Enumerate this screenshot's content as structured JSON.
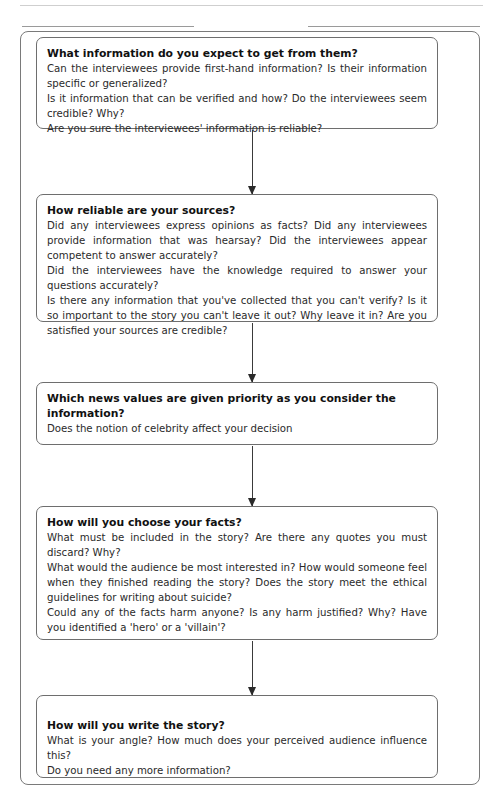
{
  "flowchart": {
    "steps": [
      {
        "title": "What information do you expect to get from them?",
        "lines": [
          "Can the interviewees provide first-hand information? Is their information specific or generalized?",
          "Is it information that can be verified and how? Do the interviewees seem credible? Why?",
          "Are you sure the interviewees' information is reliable?"
        ]
      },
      {
        "title": "How reliable are your sources?",
        "lines": [
          "Did any interviewees express opinions as facts? Did any interviewees provide information that was hearsay? Did the interviewees appear competent to answer accurately?",
          "Did the interviewees have the knowledge required to answer your questions accurately?",
          "Is there any information that you've collected that you can't verify? Is it so important to the story you can't leave it out? Why leave it in? Are you satisfied your sources are credible?"
        ]
      },
      {
        "title": "Which news values are given priority as you consider the information?",
        "lines": [
          "Does the notion of celebrity affect your decision"
        ]
      },
      {
        "title": "How will you choose your facts?",
        "lines": [
          "What must be included in the story? Are there any quotes you must discard? Why?",
          "What would the audience be most interested in? How would someone feel when they finished reading the story? Does the story meet the ethical guidelines for writing about suicide?",
          "Could any of the facts harm anyone? Is any harm justified? Why? Have you identified a 'hero' or a 'villain'?"
        ]
      },
      {
        "title": "How will you write the story?",
        "lines": [
          "What is your angle? How much does your perceived audience influence this?",
          "Do you need any more information?"
        ]
      }
    ]
  }
}
